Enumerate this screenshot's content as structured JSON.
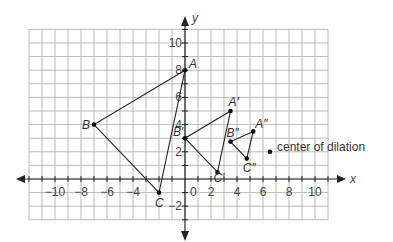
{
  "diagram": {
    "title": "",
    "axes": {
      "x_label": "x",
      "y_label": "y",
      "x_range": [
        -12,
        11
      ],
      "y_range": [
        -3,
        11
      ],
      "x_ticks": [
        {
          "value": -10,
          "label": "−10"
        },
        {
          "value": -8,
          "label": "−8"
        },
        {
          "value": -6,
          "label": "−6"
        },
        {
          "value": -4,
          "label": "−4"
        },
        {
          "value": 2,
          "label": "2"
        },
        {
          "value": 4,
          "label": "4"
        },
        {
          "value": 6,
          "label": "6"
        },
        {
          "value": 8,
          "label": "8"
        },
        {
          "value": 10,
          "label": "10"
        }
      ],
      "y_ticks": [
        {
          "value": 10,
          "label": "10"
        },
        {
          "value": 8,
          "label": "8"
        },
        {
          "value": 6,
          "label": "6"
        },
        {
          "value": 4,
          "label": "4"
        },
        {
          "value": 2,
          "label": "2"
        },
        {
          "value": -2,
          "label": "−2"
        }
      ],
      "origin_label": "0"
    },
    "triangles": [
      {
        "name": "ABC",
        "points": [
          {
            "label": "A",
            "x": 0,
            "y": 8
          },
          {
            "label": "B",
            "x": -7,
            "y": 4
          },
          {
            "label": "C",
            "x": -2,
            "y": -1
          }
        ]
      },
      {
        "name": "A'B'C'",
        "points": [
          {
            "label": "A′",
            "x": 3.5,
            "y": 5
          },
          {
            "label": "B′",
            "x": 0,
            "y": 3
          },
          {
            "label": "C′",
            "x": 2.5,
            "y": 0.5
          }
        ]
      },
      {
        "name": "A''B''C''",
        "points": [
          {
            "label": "A″",
            "x": 5.25,
            "y": 3.5
          },
          {
            "label": "B″",
            "x": 3.5,
            "y": 2.75
          },
          {
            "label": "C″",
            "x": 4.75,
            "y": 1.5
          }
        ]
      }
    ],
    "center": {
      "x": 7,
      "y": 2,
      "label": "center of dilation"
    }
  }
}
